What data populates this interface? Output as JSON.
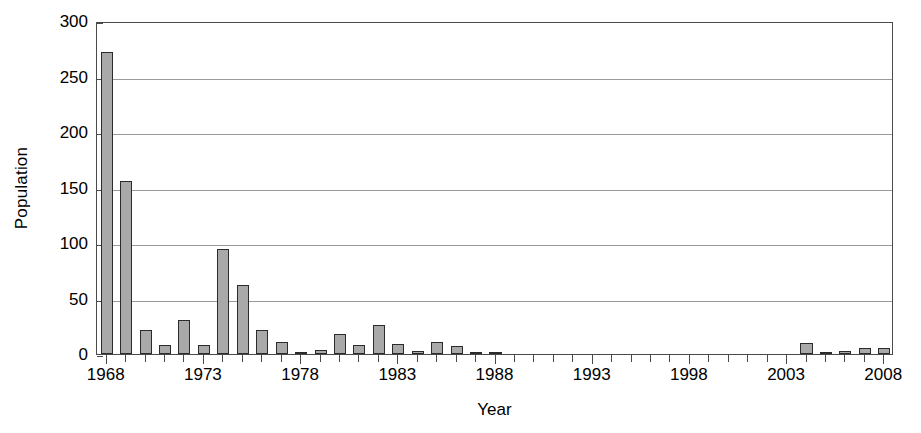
{
  "chart_data": {
    "type": "bar",
    "title": "",
    "xlabel": "Year",
    "ylabel": "Population",
    "xlim": [
      1967.5,
      2008.5
    ],
    "ylim": [
      0,
      300
    ],
    "ytick_values": [
      0,
      50,
      100,
      150,
      200,
      250,
      300
    ],
    "ytick_labels": [
      "0",
      "50",
      "100",
      "150",
      "200",
      "250",
      "300"
    ],
    "xtick_values": [
      1968,
      1973,
      1978,
      1983,
      1988,
      1993,
      1998,
      2003,
      2008
    ],
    "xtick_labels": [
      "1968",
      "1973",
      "1978",
      "1983",
      "1988",
      "1993",
      "1998",
      "2003",
      "2008"
    ],
    "grid": "horizontal",
    "legend": "none",
    "bar_color": "#a9a9a9",
    "bar_edge_color": "#2b2b2b",
    "categories": [
      1968,
      1969,
      1970,
      1971,
      1972,
      1973,
      1974,
      1975,
      1976,
      1977,
      1978,
      1979,
      1980,
      1981,
      1982,
      1983,
      1984,
      1985,
      1986,
      1987,
      1988,
      1989,
      1990,
      1991,
      1992,
      1993,
      1994,
      1995,
      1996,
      1997,
      1998,
      1999,
      2000,
      2001,
      2002,
      2003,
      2004,
      2005,
      2006,
      2007,
      2008
    ],
    "values": [
      272,
      156,
      22,
      8,
      31,
      8,
      95,
      62,
      22,
      11,
      2,
      4,
      18,
      8,
      26,
      9,
      3,
      11,
      7,
      2,
      1,
      0,
      0,
      0,
      0,
      0,
      0,
      0,
      0,
      0,
      0,
      0,
      0,
      0,
      0,
      0,
      10,
      2,
      3,
      5,
      5
    ]
  }
}
